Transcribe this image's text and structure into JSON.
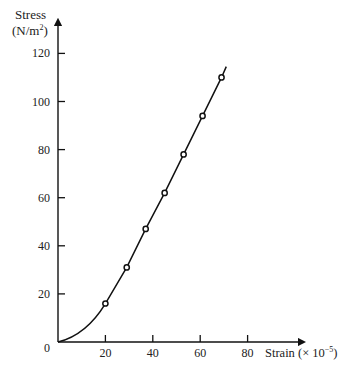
{
  "chart_data": {
    "type": "line",
    "title": "",
    "ylabel": "Stress",
    "ylabel_unit": "(N/m²)",
    "xlabel": "Strain (× 10⁻⁵)",
    "origin_label": "0",
    "xlim": [
      0,
      85
    ],
    "ylim": [
      0,
      125
    ],
    "x_ticks": [
      20,
      40,
      60,
      80
    ],
    "y_ticks": [
      20,
      40,
      60,
      80,
      100,
      120
    ],
    "grid": false,
    "legend": null,
    "series": [
      {
        "name": "Stress vs Strain",
        "markers": "open-circle",
        "x": [
          20,
          29,
          37,
          45,
          53,
          61,
          69
        ],
        "y": [
          16,
          31,
          47,
          62,
          78,
          94,
          110
        ]
      }
    ],
    "curve_note": "smooth curve from origin, concave up to ~20, then linear to ~(71,114)"
  },
  "axes": {
    "y_label_line1": "Stress",
    "y_label_line2": "(N/m",
    "y_label_sup": "2",
    "y_label_close": ")",
    "x_label_main": "Strain (× 10",
    "x_label_sup": "−5",
    "x_label_close": ")",
    "origin": "0",
    "x_tick_labels": [
      "20",
      "40",
      "60",
      "80"
    ],
    "y_tick_labels": [
      "20",
      "40",
      "60",
      "80",
      "100",
      "120"
    ]
  }
}
